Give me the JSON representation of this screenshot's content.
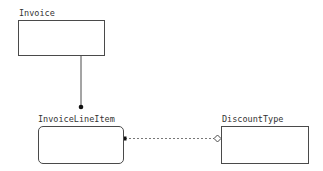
{
  "diagram": {
    "type": "class-diagram",
    "colors": {
      "line": "#4a4a4a",
      "text": "#333333",
      "background": "#ffffff"
    },
    "nodes": [
      {
        "id": "invoice",
        "label": "Invoice",
        "shape": "rectangle"
      },
      {
        "id": "invoice_line_item",
        "label": "InvoiceLineItem",
        "shape": "rounded-rectangle"
      },
      {
        "id": "discount_type",
        "label": "DiscountType",
        "shape": "rectangle"
      }
    ],
    "edges": [
      {
        "from": "invoice",
        "to": "invoice_line_item",
        "style": "solid",
        "source_end": "none",
        "target_end": "filled-circle"
      },
      {
        "from": "invoice_line_item",
        "to": "discount_type",
        "style": "dashed",
        "source_end": "filled-square",
        "target_end": "hollow-diamond"
      }
    ]
  }
}
